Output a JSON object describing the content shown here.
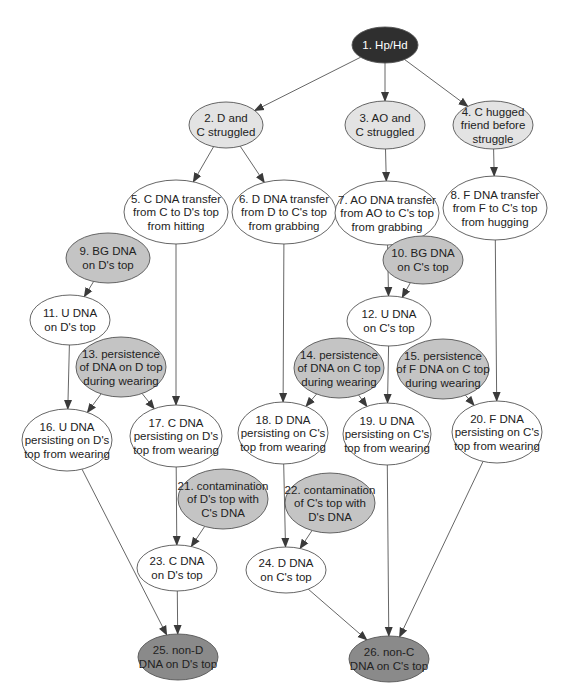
{
  "colors": {
    "root": "#2f2f2f",
    "root_text": "#ffffff",
    "light": "#e3e3e3",
    "medium": "#c4c4c4",
    "dark": "#8a8a8a",
    "white": "#ffffff",
    "stroke": "#555555",
    "text": "#222222"
  },
  "nodes": [
    {
      "id": 1,
      "lines": [
        "1. Hp/Hd"
      ],
      "cx": 385,
      "cy": 45,
      "rx": 33,
      "ry": 18,
      "fill": "root"
    },
    {
      "id": 2,
      "lines": [
        "2. D and",
        "C struggled"
      ],
      "cx": 226,
      "cy": 125,
      "rx": 37,
      "ry": 23,
      "fill": "light"
    },
    {
      "id": 3,
      "lines": [
        "3. AO and",
        "C struggled"
      ],
      "cx": 385,
      "cy": 125,
      "rx": 40,
      "ry": 24,
      "fill": "light"
    },
    {
      "id": 4,
      "lines": [
        "4. C hugged",
        "friend before",
        "struggle"
      ],
      "cx": 493,
      "cy": 125,
      "rx": 40,
      "ry": 24,
      "fill": "light"
    },
    {
      "id": 5,
      "lines": [
        "5. C DNA transfer",
        "from C to D's top",
        "from hitting"
      ],
      "cx": 176,
      "cy": 212,
      "rx": 52,
      "ry": 32,
      "fill": "white"
    },
    {
      "id": 6,
      "lines": [
        "6. D DNA transfer",
        "from D to C's top",
        "from grabbing"
      ],
      "cx": 284,
      "cy": 212,
      "rx": 52,
      "ry": 32,
      "fill": "white"
    },
    {
      "id": 7,
      "lines": [
        "7. AO DNA transfer",
        "from AO to C's top",
        "from grabbing"
      ],
      "cx": 387,
      "cy": 213,
      "rx": 52,
      "ry": 32,
      "fill": "white"
    },
    {
      "id": 8,
      "lines": [
        "8. F DNA transfer",
        "from F to C's top",
        "from hugging"
      ],
      "cx": 495,
      "cy": 208,
      "rx": 52,
      "ry": 32,
      "fill": "white"
    },
    {
      "id": 9,
      "lines": [
        "9. BG DNA",
        "on D's top"
      ],
      "cx": 108,
      "cy": 258,
      "rx": 42,
      "ry": 25,
      "fill": "medium"
    },
    {
      "id": 10,
      "lines": [
        "10. BG DNA",
        "on C's top"
      ],
      "cx": 423,
      "cy": 260,
      "rx": 40,
      "ry": 24,
      "fill": "medium"
    },
    {
      "id": 11,
      "lines": [
        "11. U DNA",
        "on D's top"
      ],
      "cx": 70,
      "cy": 320,
      "rx": 40,
      "ry": 25,
      "fill": "white"
    },
    {
      "id": 12,
      "lines": [
        "12. U DNA",
        "on C's top"
      ],
      "cx": 389,
      "cy": 321,
      "rx": 42,
      "ry": 25,
      "fill": "white"
    },
    {
      "id": 13,
      "lines": [
        "13. persistence",
        "of DNA on D top",
        "during wearing"
      ],
      "cx": 121,
      "cy": 367,
      "rx": 45,
      "ry": 30,
      "fill": "medium"
    },
    {
      "id": 14,
      "lines": [
        "14. persistence",
        "of DNA on C top",
        "during wearing"
      ],
      "cx": 339,
      "cy": 368,
      "rx": 45,
      "ry": 30,
      "fill": "medium"
    },
    {
      "id": 15,
      "lines": [
        "15. persistence",
        "of F DNA on C top",
        "during wearing"
      ],
      "cx": 443,
      "cy": 369,
      "rx": 46,
      "ry": 30,
      "fill": "medium"
    },
    {
      "id": 16,
      "lines": [
        "16. U DNA",
        "persisting on D's",
        "top from wearing"
      ],
      "cx": 67,
      "cy": 440,
      "rx": 45,
      "ry": 31,
      "fill": "white"
    },
    {
      "id": 17,
      "lines": [
        "17. C DNA",
        "persisting on D's",
        "top from wearing"
      ],
      "cx": 176,
      "cy": 436,
      "rx": 46,
      "ry": 31,
      "fill": "white"
    },
    {
      "id": 18,
      "lines": [
        "18. D DNA",
        "persisting on C's",
        "top from wearing"
      ],
      "cx": 283,
      "cy": 433,
      "rx": 45,
      "ry": 31,
      "fill": "white"
    },
    {
      "id": 19,
      "lines": [
        "19. U DNA",
        "persisting on C's",
        "top from wearing"
      ],
      "cx": 387,
      "cy": 434,
      "rx": 44,
      "ry": 31,
      "fill": "white"
    },
    {
      "id": 20,
      "lines": [
        "20. F DNA",
        "persisting on C's",
        "top from wearing"
      ],
      "cx": 497,
      "cy": 432,
      "rx": 45,
      "ry": 31,
      "fill": "white"
    },
    {
      "id": 21,
      "lines": [
        "21. contamination",
        "of D's top with",
        "C's DNA"
      ],
      "cx": 223,
      "cy": 499,
      "rx": 45,
      "ry": 30,
      "fill": "medium"
    },
    {
      "id": 22,
      "lines": [
        "22. contamination",
        "of C's top with",
        "D's DNA"
      ],
      "cx": 330,
      "cy": 503,
      "rx": 45,
      "ry": 30,
      "fill": "medium"
    },
    {
      "id": 23,
      "lines": [
        "23. C DNA",
        "on D's top"
      ],
      "cx": 177,
      "cy": 568,
      "rx": 40,
      "ry": 23,
      "fill": "white"
    },
    {
      "id": 24,
      "lines": [
        "24. D DNA",
        "on C's top"
      ],
      "cx": 286,
      "cy": 570,
      "rx": 40,
      "ry": 23,
      "fill": "white"
    },
    {
      "id": 25,
      "lines": [
        "25. non-D",
        "DNA on D's top"
      ],
      "cx": 178,
      "cy": 657,
      "rx": 40,
      "ry": 23,
      "fill": "dark"
    },
    {
      "id": 26,
      "lines": [
        "26. non-C",
        "DNA on C's top"
      ],
      "cx": 389,
      "cy": 659,
      "rx": 40,
      "ry": 23,
      "fill": "dark"
    }
  ],
  "edges": [
    [
      1,
      2
    ],
    [
      1,
      3
    ],
    [
      1,
      4
    ],
    [
      2,
      5
    ],
    [
      2,
      6
    ],
    [
      3,
      7
    ],
    [
      4,
      8
    ],
    [
      9,
      11
    ],
    [
      10,
      12
    ],
    [
      7,
      12
    ],
    [
      11,
      16
    ],
    [
      13,
      16
    ],
    [
      13,
      17
    ],
    [
      5,
      17
    ],
    [
      6,
      18
    ],
    [
      14,
      18
    ],
    [
      14,
      19
    ],
    [
      12,
      19
    ],
    [
      15,
      20
    ],
    [
      8,
      20
    ],
    [
      17,
      23
    ],
    [
      21,
      23
    ],
    [
      18,
      24
    ],
    [
      22,
      24
    ],
    [
      16,
      25
    ],
    [
      23,
      25
    ],
    [
      24,
      26
    ],
    [
      19,
      26
    ],
    [
      20,
      26
    ]
  ]
}
